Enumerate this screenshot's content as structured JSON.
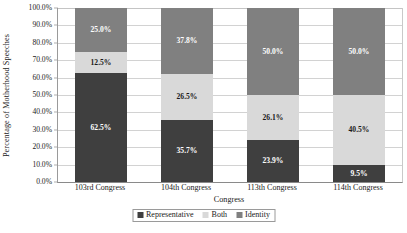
{
  "chart_data": {
    "type": "bar",
    "subtype": "stacked-bar-100-percent",
    "title": "",
    "xlabel": "Congress",
    "ylabel": "Percentage of Motherhood Speeches",
    "categories": [
      "103rd Congress",
      "104th Congress",
      "113th Congress",
      "114th Congress"
    ],
    "series": [
      {
        "name": "Representative",
        "color": "#3f3f3f",
        "values": [
          62.5,
          35.7,
          23.9,
          9.5
        ],
        "labels": [
          "62.5%",
          "35.7%",
          "23.9%",
          "9.5%"
        ]
      },
      {
        "name": "Both",
        "color": "#d9d9d9",
        "values": [
          12.5,
          26.5,
          26.1,
          40.5
        ],
        "labels": [
          "12.5%",
          "26.5%",
          "26.1%",
          "40.5%"
        ]
      },
      {
        "name": "Identity",
        "color": "#808080",
        "values": [
          25.0,
          37.8,
          50.0,
          50.0
        ],
        "labels": [
          "25.0%",
          "37.8%",
          "50.0%",
          "50.0%"
        ]
      }
    ],
    "ylim": [
      0,
      100
    ],
    "ytick_values": [
      0,
      10,
      20,
      30,
      40,
      50,
      60,
      70,
      80,
      90,
      100
    ],
    "ytick_labels": [
      "0.0%",
      "10.0%",
      "20.0%",
      "30.0%",
      "40.0%",
      "50.0%",
      "60.0%",
      "70.0%",
      "80.0%",
      "90.0%",
      "100.0%"
    ],
    "grid": true,
    "grid_axis": "y",
    "legend_position": "bottom",
    "legend_entries": [
      "Representative",
      "Both",
      "Identity"
    ]
  },
  "axes": {
    "y_title": "Percentage of Motherhood Speeches",
    "x_title": "Congress"
  }
}
